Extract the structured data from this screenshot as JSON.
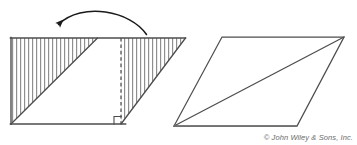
{
  "figure": {
    "credit": "© John Wiley & Sons, Inc.",
    "colors": {
      "outline": "#4d4d4d",
      "hatch": "#8c8c8c",
      "fill": "#ffffff",
      "arrow": "#1a1a1a",
      "credit_text": "#6b6b6b",
      "background": "#ffffff"
    },
    "left_shape": {
      "name": "hatched-parallelogram",
      "top_left": [
        11,
        38
      ],
      "top_right": [
        185,
        38
      ],
      "bottom_left": [
        11,
        124
      ],
      "bottom_right": [
        125,
        124
      ],
      "cut_line_x": 121,
      "cut_line_style": "dashed",
      "hatch_orientation": "vertical",
      "hatch_spacing_px": 4,
      "right_angle_marker": [
        114,
        116
      ]
    },
    "right_shape": {
      "name": "plain-parallelogram",
      "top_left": [
        222,
        37
      ],
      "top_right": [
        344,
        37
      ],
      "bottom_right": [
        297,
        126
      ],
      "bottom_left": [
        174,
        126
      ],
      "diagonal_from": [
        174,
        126
      ],
      "diagonal_to": [
        344,
        37
      ]
    },
    "arrow": {
      "name": "rotation-arrow",
      "start": [
        146,
        34
      ],
      "control": [
        100,
        2
      ],
      "end": [
        57,
        26
      ],
      "direction": "right-to-left",
      "style": "curved-arc"
    }
  }
}
